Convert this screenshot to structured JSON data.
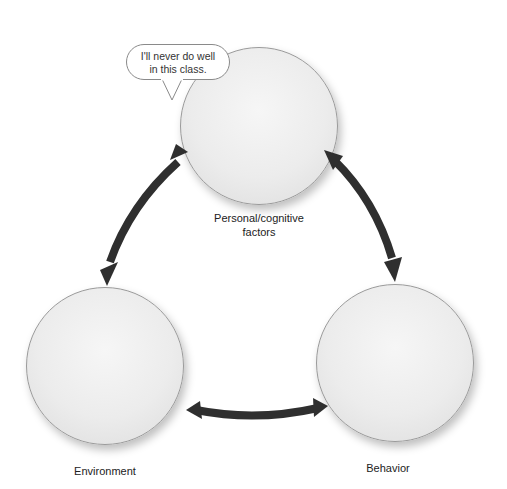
{
  "diagram": {
    "speech_bubble": {
      "line1": "I'll never do well",
      "line2": "in this class."
    },
    "nodes": [
      {
        "id": "personal",
        "label_line1": "Personal/cognitive",
        "label_line2": "factors",
        "illustration": "Man seated at a desk, hand on forehead, looking discouraged at a paper"
      },
      {
        "id": "environment",
        "label": "Environment",
        "illustration": "Woman in striped sweater reading a graded paper marked F"
      },
      {
        "id": "behavior",
        "label": "Behavior",
        "illustration": "Woman and man smiling together over an open book with a pencil"
      }
    ],
    "edges": [
      {
        "from": "personal",
        "to": "environment",
        "type": "bidirectional"
      },
      {
        "from": "personal",
        "to": "behavior",
        "type": "bidirectional"
      },
      {
        "from": "environment",
        "to": "behavior",
        "type": "bidirectional"
      }
    ],
    "colors": {
      "arrow": "#2f2f2f",
      "circle_border": "#9a9a9a",
      "circle_fill": "#ececec",
      "text": "#222222"
    }
  }
}
